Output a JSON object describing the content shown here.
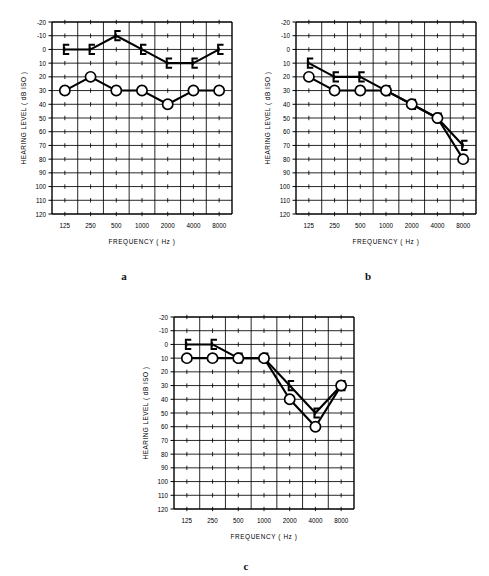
{
  "figure": {
    "panel_letters": [
      "a",
      "b",
      "c"
    ]
  },
  "axes": {
    "ylabel": "HEARING  LEVEL   ( dB   ISO )",
    "xlabel": "FREQUENCY   ( Hz )",
    "yticks": [
      "-20",
      "-10",
      "0",
      "10",
      "20",
      "30",
      "40",
      "50",
      "60",
      "70",
      "80",
      "90",
      "100",
      "110",
      "120"
    ],
    "xticks": [
      "125",
      "250",
      "500",
      "1000",
      "2000",
      "4000",
      "8000"
    ],
    "ylim": [
      -20,
      120
    ],
    "ystep": 10,
    "grid": true,
    "colors": {
      "ink": "#000000",
      "grid": "#000000",
      "background": "#ffffff"
    }
  },
  "chart_data": [
    {
      "type": "line",
      "panel": "a",
      "title": "",
      "xlabel": "FREQUENCY   ( Hz )",
      "ylabel": "HEARING  LEVEL   ( dB   ISO )",
      "x": [
        125,
        250,
        500,
        1000,
        2000,
        4000,
        8000
      ],
      "xlabels": [
        "125",
        "250",
        "500",
        "1000",
        "2000",
        "4000",
        "8000"
      ],
      "ylim": [
        -20,
        120
      ],
      "grid": true,
      "legend": "none",
      "series": [
        {
          "name": "Bone conduction (masked)",
          "marker": "bracket",
          "values": [
            0,
            0,
            -10,
            0,
            10,
            10,
            0
          ]
        },
        {
          "name": "Air conduction",
          "marker": "circle",
          "values": [
            30,
            20,
            30,
            30,
            40,
            30,
            30
          ]
        }
      ]
    },
    {
      "type": "line",
      "panel": "b",
      "title": "",
      "xlabel": "FREQUENCY   ( Hz )",
      "ylabel": "HEARING  LEVEL   ( dB   ISO )",
      "x": [
        125,
        250,
        500,
        1000,
        2000,
        4000,
        8000
      ],
      "xlabels": [
        "125",
        "250",
        "500",
        "1000",
        "2000",
        "4000",
        "8000"
      ],
      "ylim": [
        -20,
        120
      ],
      "grid": true,
      "legend": "none",
      "series": [
        {
          "name": "Bone conduction (masked)",
          "marker": "bracket",
          "values": [
            10,
            20,
            20,
            30,
            40,
            50,
            70
          ]
        },
        {
          "name": "Air conduction",
          "marker": "circle",
          "values": [
            20,
            30,
            30,
            30,
            40,
            50,
            80
          ]
        }
      ]
    },
    {
      "type": "line",
      "panel": "c",
      "title": "",
      "xlabel": "FREQUENCY   ( Hz )",
      "ylabel": "HEARING  LEVEL   ( dB   ISO )",
      "x": [
        125,
        250,
        500,
        1000,
        2000,
        4000,
        8000
      ],
      "xlabels": [
        "125",
        "250",
        "500",
        "1000",
        "2000",
        "4000",
        "8000"
      ],
      "ylim": [
        -20,
        120
      ],
      "grid": true,
      "legend": "none",
      "series": [
        {
          "name": "Bone conduction (masked)",
          "marker": "bracket",
          "values": [
            0,
            0,
            10,
            10,
            30,
            50,
            30
          ]
        },
        {
          "name": "Air conduction",
          "marker": "circle",
          "values": [
            10,
            10,
            10,
            10,
            40,
            60,
            30
          ]
        }
      ]
    }
  ]
}
